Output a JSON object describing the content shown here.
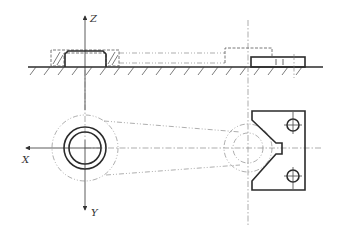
{
  "diagram": {
    "type": "engineering drawing — fixture with V-block locating a round part and linkage arm, two orthographic views",
    "axes": {
      "z_label": "Z",
      "x_label": "X",
      "y_label": "Y"
    },
    "views": [
      {
        "name": "front-view",
        "description": "Section with hatched ground line, cylindrical workpiece in hatched cup, dashed linkage arm, V-block on right"
      },
      {
        "name": "top-view",
        "description": "Concentric circles of round part at origin, phantom arm outline extending to V-block with notch and two bolt holes"
      }
    ],
    "colors": {
      "line": "#2b2b2b",
      "center_line": "#777777",
      "background": "#ffffff"
    }
  }
}
